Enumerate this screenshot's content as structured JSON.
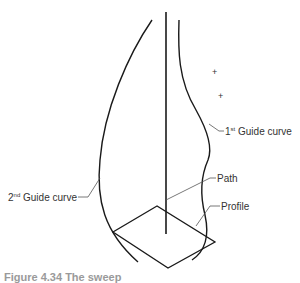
{
  "diagram": {
    "labels": {
      "guide1_prefix": "1",
      "guide1_sup": "st",
      "guide1_text": " Guide curve",
      "guide2_prefix": "2",
      "guide2_sup": "nd",
      "guide2_text": " Guide curve",
      "path": "Path",
      "profile": "Profile"
    },
    "markers": [
      {
        "symbol": "+",
        "x": 215,
        "y": 72
      },
      {
        "symbol": "+",
        "x": 221,
        "y": 96
      }
    ],
    "caption": "Figure 4.34 The sweep"
  },
  "colors": {
    "stroke": "#1a1a1a",
    "leader": "#555555",
    "text": "#333333"
  }
}
